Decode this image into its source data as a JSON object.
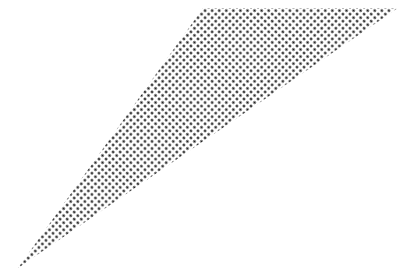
{
  "figure": {
    "shape": "halftone-triangle",
    "background": "#ffffff",
    "dot_color": "#1a1a1a",
    "dot_spacing": 5,
    "dot_radius": 1.3,
    "vertices": [
      [
        203,
        8
      ],
      [
        398,
        8
      ],
      [
        18,
        268
      ]
    ]
  }
}
